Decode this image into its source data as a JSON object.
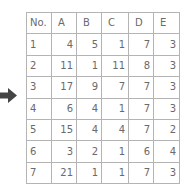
{
  "arrow": {
    "icon": "right-arrow-icon",
    "color": "#444444"
  },
  "table": {
    "headers": [
      "No.",
      "A",
      "B",
      "C",
      "D",
      "E"
    ],
    "rows": [
      [
        "1",
        "4",
        "5",
        "1",
        "7",
        "3"
      ],
      [
        "2",
        "11",
        "1",
        "11",
        "8",
        "3"
      ],
      [
        "3",
        "17",
        "9",
        "7",
        "7",
        "3"
      ],
      [
        "4",
        "6",
        "4",
        "1",
        "7",
        "3"
      ],
      [
        "5",
        "15",
        "4",
        "4",
        "7",
        "2"
      ],
      [
        "6",
        "3",
        "2",
        "1",
        "6",
        "4"
      ],
      [
        "7",
        "21",
        "1",
        "1",
        "7",
        "3"
      ]
    ]
  }
}
